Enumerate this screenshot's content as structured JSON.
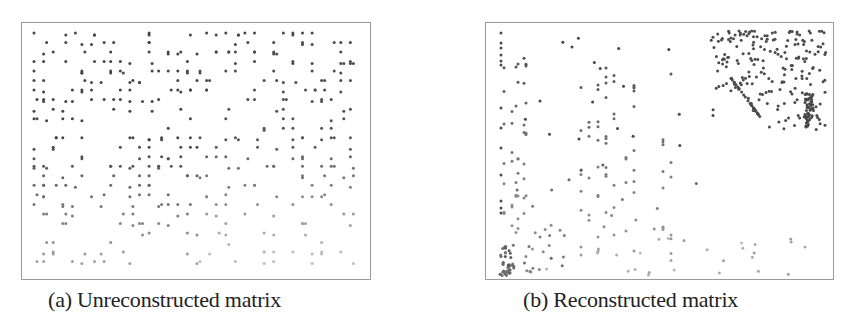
{
  "figure": {
    "panels": [
      {
        "id": "a",
        "caption": "(a) Unreconstructed matrix",
        "description": "Sparse matrix with nonzero entries scattered fairly uniformly; darker in upper rows, fading toward bottom",
        "dot_color": "#4a4a4a",
        "fade_color": "#bdbdbd"
      },
      {
        "id": "b",
        "caption": "(b) Reconstructed matrix",
        "description": "Reordered sparse matrix with nonzeros concentrated in dense block at upper-right and a small dense cluster at lower-left corner, plus vertical column bands",
        "dot_color": "#4a4a4a",
        "fade_color": "#bdbdbd"
      }
    ]
  }
}
